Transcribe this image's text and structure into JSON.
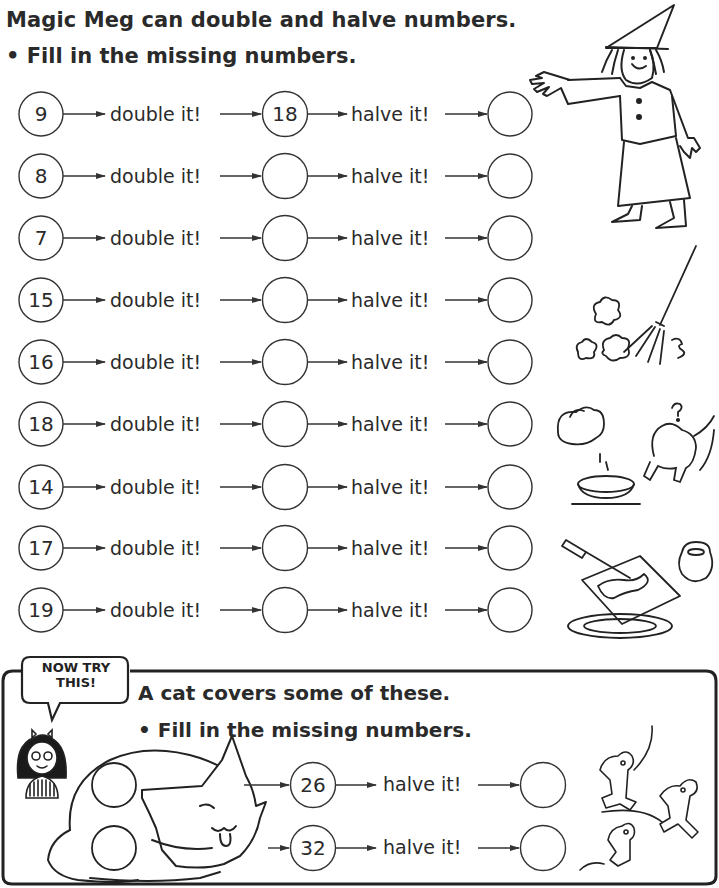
{
  "header": {
    "title": "Magic Meg can double and halve numbers.",
    "instruction": "• Fill in the missing numbers."
  },
  "labels": {
    "double": "double it!",
    "halve": "halve it!"
  },
  "rows": [
    {
      "start": "9",
      "doubled": "18",
      "halved": ""
    },
    {
      "start": "8",
      "doubled": "",
      "halved": ""
    },
    {
      "start": "7",
      "doubled": "",
      "halved": ""
    },
    {
      "start": "15",
      "doubled": "",
      "halved": ""
    },
    {
      "start": "16",
      "doubled": "",
      "halved": ""
    },
    {
      "start": "18",
      "doubled": "",
      "halved": ""
    },
    {
      "start": "14",
      "doubled": "",
      "halved": ""
    },
    {
      "start": "17",
      "doubled": "",
      "halved": ""
    },
    {
      "start": "19",
      "doubled": "",
      "halved": ""
    }
  ],
  "now_try_this": {
    "bubble_label": "NOW TRY THIS!",
    "bubble_line1": "NOW TRY",
    "bubble_line2": "THIS!",
    "title": "A cat covers some of these.",
    "instruction": "• Fill in the missing numbers.",
    "halve_label": "halve it!",
    "rows": [
      {
        "hidden": "",
        "value": "26",
        "halved": ""
      },
      {
        "hidden": "",
        "value": "32",
        "halved": ""
      }
    ]
  },
  "illustrations": [
    "witch-meg",
    "broom-sweeping",
    "jug-and-cat",
    "knife-and-toast",
    "girl-presenter",
    "sleeping-cat",
    "scared-mice"
  ],
  "colors": {
    "ink": "#2a2a2a",
    "paper": "#ffffff"
  }
}
